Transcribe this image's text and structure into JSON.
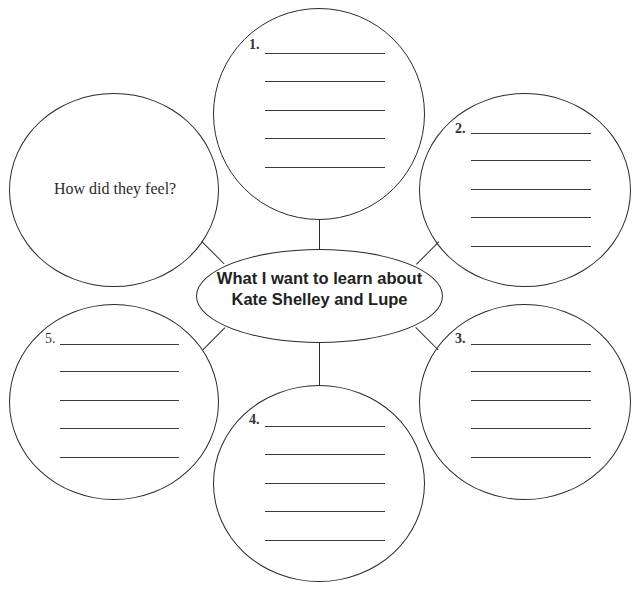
{
  "worksheet": {
    "center": {
      "line1": "What I want to learn about",
      "line2": "Kate Shelley and Lupe"
    },
    "prompt_circle": {
      "text": "How did they feel?"
    },
    "numbered_circles": [
      {
        "label": "1."
      },
      {
        "label": "2."
      },
      {
        "label": "3."
      },
      {
        "label": "4."
      },
      {
        "label": "5."
      }
    ],
    "line_color": "#2b2b2b",
    "background": "#ffffff"
  }
}
